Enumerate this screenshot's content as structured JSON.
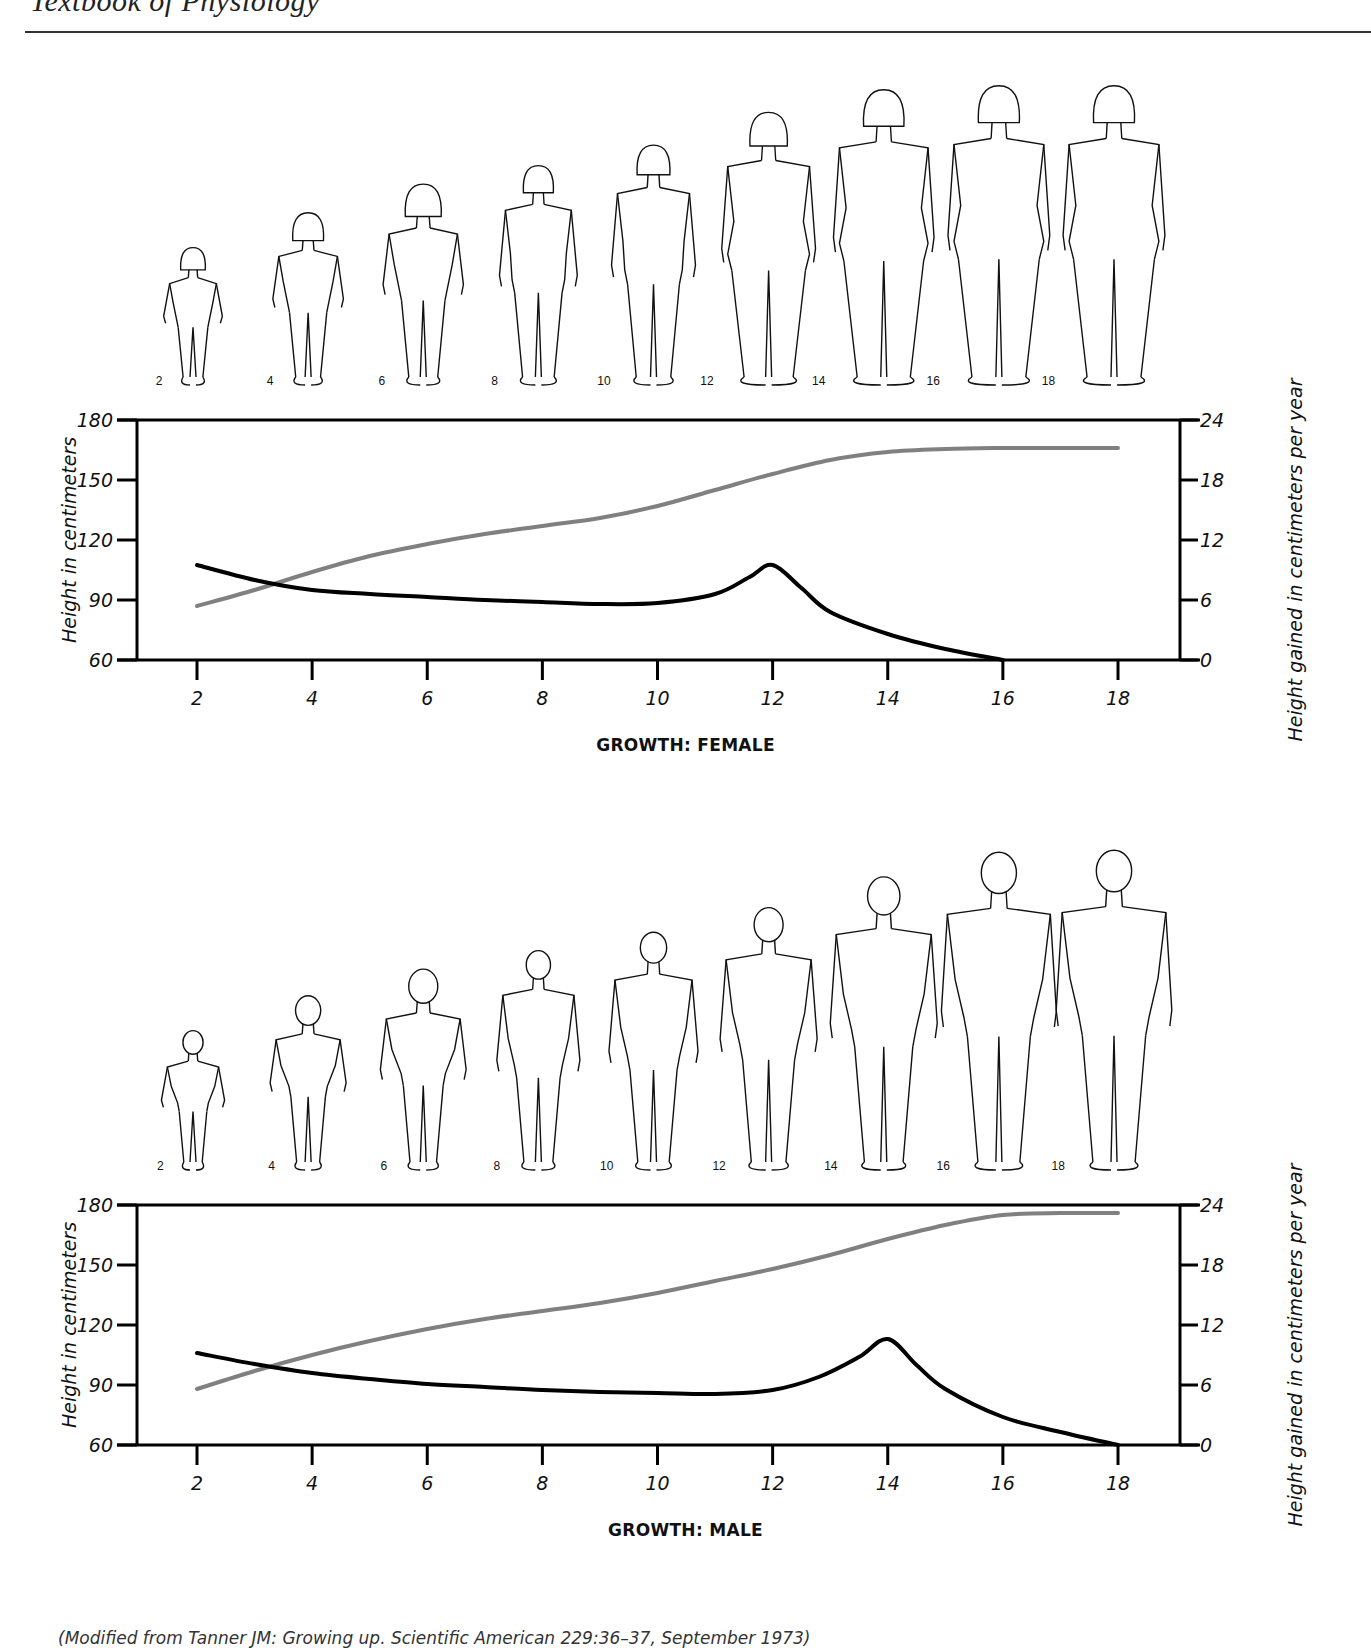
{
  "page": {
    "running_head": "Textbook of Physiology",
    "citation": "(Modified from Tanner JM: Growing up. Scientific American 229:36–37, September 1973)"
  },
  "colors": {
    "height_line": "#808080",
    "velocity_line": "#000000",
    "axis": "#000000"
  },
  "chart_data": [
    {
      "type": "line",
      "title": "GROWTH: FEMALE",
      "xlabel": "",
      "ylabel": "Height in centimeters",
      "y2label": "Height gained in centimeters per year",
      "x_ticks": [
        2,
        4,
        6,
        8,
        10,
        12,
        14,
        16,
        18
      ],
      "y_ticks": [
        60,
        90,
        120,
        150,
        180
      ],
      "y2_ticks": [
        0,
        6,
        12,
        18,
        24
      ],
      "xlim": [
        0.3,
        20.5
      ],
      "ylim": [
        60,
        180
      ],
      "y2lim": [
        0,
        24
      ],
      "grid": false,
      "legend": null,
      "figure_ages": [
        2,
        4,
        6,
        8,
        10,
        12,
        14,
        16,
        18
      ],
      "series": [
        {
          "name": "Height (cm)",
          "axis": "left",
          "color": "#808080",
          "x": [
            2,
            3,
            4,
            5,
            6,
            7,
            8,
            9,
            10,
            11,
            12,
            13,
            14,
            15,
            16,
            17,
            18
          ],
          "values": [
            87,
            95,
            104,
            112,
            118,
            123,
            127,
            131,
            137,
            145,
            153,
            160,
            164,
            165.5,
            166,
            166,
            166
          ]
        },
        {
          "name": "Height gained per year (cm/yr)",
          "axis": "right",
          "color": "#000000",
          "x": [
            2,
            3,
            4,
            5,
            6,
            7,
            8,
            9,
            10,
            11,
            11.6,
            12,
            12.5,
            13,
            14,
            15,
            16
          ],
          "values": [
            9.5,
            8.0,
            7.0,
            6.6,
            6.3,
            6.0,
            5.8,
            5.6,
            5.7,
            6.6,
            8.3,
            9.5,
            7.2,
            4.8,
            2.6,
            1.1,
            0
          ]
        }
      ]
    },
    {
      "type": "line",
      "title": "GROWTH: MALE",
      "xlabel": "",
      "ylabel": "Height in centimeters",
      "y2label": "Height gained in centimeters per year",
      "x_ticks": [
        2,
        4,
        6,
        8,
        10,
        12,
        14,
        16,
        18
      ],
      "y_ticks": [
        60,
        90,
        120,
        150,
        180
      ],
      "y2_ticks": [
        0,
        6,
        12,
        18,
        24
      ],
      "xlim": [
        0.3,
        20.5
      ],
      "ylim": [
        60,
        180
      ],
      "y2lim": [
        0,
        24
      ],
      "grid": false,
      "legend": null,
      "figure_ages": [
        2,
        4,
        6,
        8,
        10,
        12,
        14,
        16,
        18
      ],
      "series": [
        {
          "name": "Height (cm)",
          "axis": "left",
          "color": "#808080",
          "x": [
            2,
            3,
            4,
            5,
            6,
            7,
            8,
            9,
            10,
            11,
            12,
            13,
            14,
            15,
            16,
            17,
            18
          ],
          "values": [
            88,
            97,
            105,
            112,
            118,
            123,
            127,
            131,
            136,
            142,
            148,
            155,
            163,
            170,
            175,
            176,
            176
          ]
        },
        {
          "name": "Height gained per year (cm/yr)",
          "axis": "right",
          "color": "#000000",
          "x": [
            2,
            3,
            4,
            5,
            6,
            7,
            8,
            9,
            10,
            11,
            12,
            12.8,
            13.5,
            14,
            14.5,
            15,
            16,
            17,
            18
          ],
          "values": [
            9.2,
            8.1,
            7.2,
            6.6,
            6.1,
            5.8,
            5.5,
            5.3,
            5.2,
            5.1,
            5.5,
            6.8,
            8.8,
            10.6,
            8.0,
            5.6,
            2.8,
            1.3,
            0
          ]
        }
      ]
    }
  ]
}
